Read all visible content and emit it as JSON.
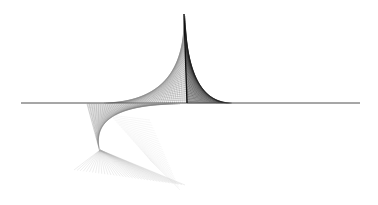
{
  "figure": {
    "title": "String-art envelope curves",
    "background": "#ffffff",
    "baseline": {
      "x1": 21,
      "x2": 360,
      "y": 103,
      "color": "#3a3a3a",
      "width": 0.9
    },
    "mast": {
      "x1": 184,
      "y1": 14,
      "x2": 187,
      "y2": 103,
      "color": "#111111",
      "width": 1.4
    },
    "families": [
      {
        "name": "upper-left-fan",
        "color": "#8a8a8a",
        "opacity": 0.75,
        "width": 0.5,
        "count": 40,
        "from": {
          "x0": 104,
          "y0": 103,
          "x1": 187,
          "y1": 103
        },
        "to": {
          "x0": 187,
          "y0": 100,
          "x1": 184,
          "y1": 14
        }
      },
      {
        "name": "right-sail-dense",
        "color": "#1a1a1a",
        "opacity": 0.7,
        "width": 0.45,
        "count": 50,
        "from": {
          "x0": 185,
          "y0": 16,
          "x1": 187,
          "y1": 103
        },
        "to": {
          "x0": 187,
          "y0": 103,
          "x1": 232,
          "y1": 103
        }
      },
      {
        "name": "lower-cusp",
        "color": "#7a7a7a",
        "opacity": 0.6,
        "width": 0.45,
        "count": 40,
        "from": {
          "x0": 87,
          "y0": 104,
          "x1": 180,
          "y1": 104
        },
        "to": {
          "x0": 100,
          "y0": 152,
          "x1": 87,
          "y1": 104
        }
      },
      {
        "name": "lower-fan",
        "color": "#aaaaaa",
        "opacity": 0.45,
        "width": 0.45,
        "count": 36,
        "from": {
          "x0": 100,
          "y0": 150,
          "x1": 100,
          "y1": 150
        },
        "to": {
          "x0": 74,
          "y0": 170,
          "x1": 185,
          "y1": 185
        }
      },
      {
        "name": "faint-wash",
        "color": "#c4c4c4",
        "opacity": 0.35,
        "width": 0.4,
        "count": 26,
        "from": {
          "x0": 110,
          "y0": 115,
          "x1": 150,
          "y1": 160
        },
        "to": {
          "x0": 150,
          "y0": 120,
          "x1": 180,
          "y1": 190
        }
      }
    ]
  }
}
